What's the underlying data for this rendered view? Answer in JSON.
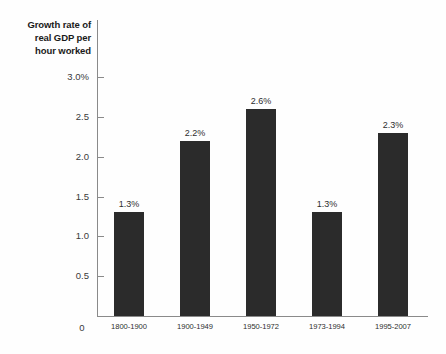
{
  "chart_data": {
    "type": "bar",
    "title": "Growth rate of real GDP per hour worked",
    "title_lines": [
      "Growth rate of",
      "real GDP per",
      "hour worked"
    ],
    "xlabel": "",
    "ylabel": "Growth rate of real GDP per hour worked",
    "ylim": [
      0,
      3.0
    ],
    "grid": false,
    "legend": "none",
    "bar_color": "#2b2b2b",
    "axis_color": "#8a8a8a",
    "background_color": "#fefefe",
    "ytick_labels": [
      "3.0%",
      "2.5",
      "2.0",
      "1.5",
      "1.0",
      "0.5",
      "0"
    ],
    "ytick_values": [
      3.0,
      2.5,
      2.0,
      1.5,
      1.0,
      0.5,
      0
    ],
    "categories": [
      "1800-1900",
      "1900-1949",
      "1950-1972",
      "1973-1994",
      "1995-2007"
    ],
    "values": [
      1.3,
      2.2,
      2.6,
      1.3,
      2.3
    ],
    "data_labels": [
      "1.3%",
      "2.2%",
      "2.6%",
      "1.3%",
      "2.3%"
    ]
  }
}
